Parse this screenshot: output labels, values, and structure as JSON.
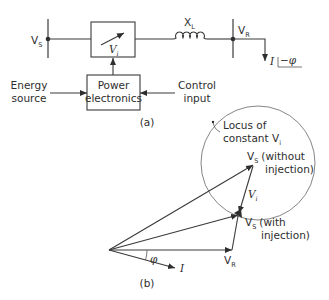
{
  "figure_a": {
    "caption": "(a)",
    "sending_bus": {
      "label": "V",
      "subscript": "S"
    },
    "injection_box": {
      "label": "V",
      "subscript": "i"
    },
    "reactance": {
      "label": "X",
      "subscript": "L"
    },
    "receiving_bus": {
      "label": "V",
      "subscript": "R"
    },
    "load_current": {
      "label": "I",
      "angle": "−φ"
    },
    "power_electronics": {
      "line1": "Power",
      "line2": "electronics"
    },
    "energy_source": {
      "line1": "Energy",
      "line2": "source"
    },
    "control_input": {
      "line1": "Control",
      "line2": "input"
    }
  },
  "figure_b": {
    "caption": "(b)",
    "locus": {
      "line1": "Locus of",
      "line2": "constant V",
      "subscript": "i"
    },
    "vs_without": {
      "label": "V",
      "subscript": "S",
      "line1": "(without",
      "line2": "injection)"
    },
    "vs_with": {
      "label": "V",
      "subscript": "S",
      "line1": "(with",
      "line2": "injection)"
    },
    "vi": {
      "label": "V",
      "subscript": "i"
    },
    "vr": {
      "label": "V",
      "subscript": "R"
    },
    "current": {
      "label": "I"
    },
    "angle": {
      "label": "φ"
    }
  },
  "colors": {
    "line": "#3a3a3a",
    "text": "#2e2e2e",
    "circle": "#777777"
  }
}
